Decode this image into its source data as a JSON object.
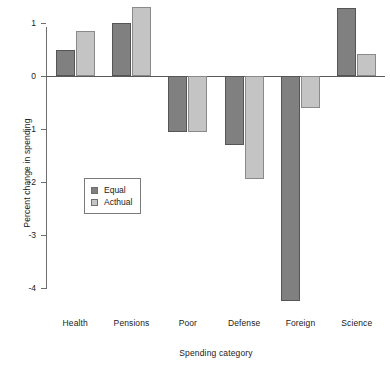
{
  "chart_data": {
    "type": "bar",
    "title": "",
    "subtitle": "",
    "xlabel": "Spending category",
    "ylabel": "Percent change in spending",
    "categories": [
      "Health",
      "Pensions",
      "Poor",
      "Defense",
      "Foreign",
      "Science"
    ],
    "series": [
      {
        "name": "Equal",
        "color": "#808080",
        "edge_color": "#555555",
        "values": [
          0.5,
          1.0,
          -1.05,
          -1.3,
          -4.25,
          1.28
        ]
      },
      {
        "name": "Acthual",
        "color": "#c4c4c4",
        "edge_color": "#8a8a8a",
        "values": [
          0.85,
          1.3,
          -1.05,
          -1.95,
          -0.6,
          0.42
        ]
      }
    ],
    "yticks": [
      1,
      0,
      -1,
      -2,
      -3,
      -4
    ],
    "ytick_labels": [
      "1",
      "0",
      "-1",
      "-2",
      "-3",
      "-4"
    ],
    "ylim": [
      -4.5,
      1.45
    ],
    "grid": false,
    "legend_position": "center-left",
    "legend_entries": [
      {
        "label": "Equal",
        "color": "#808080"
      },
      {
        "label": "Acthual",
        "color": "#c4c4c4"
      }
    ],
    "axis_color": "#6e6e6e",
    "background_color": "#ffffff"
  }
}
